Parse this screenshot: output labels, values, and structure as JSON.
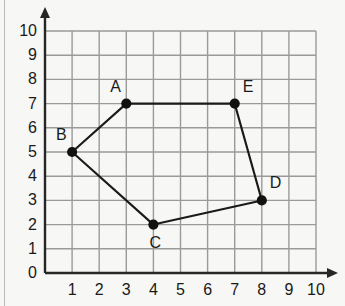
{
  "figure": {
    "background_color": "#f7f7f5",
    "grid_color": "#9a9a9a",
    "axis_color": "#262626",
    "point_color": "#111111",
    "edge_color": "#1a1a1a",
    "label_color": "#1a1a1a"
  },
  "chart_data": {
    "type": "scatter",
    "title": "",
    "xlabel": "",
    "ylabel": "",
    "xlim": [
      0,
      10
    ],
    "ylim": [
      0,
      10
    ],
    "grid": true,
    "legend": "none",
    "x_tick_labels": [
      "1",
      "2",
      "3",
      "4",
      "5",
      "6",
      "7",
      "8",
      "9",
      "10"
    ],
    "x_tick_values": [
      1,
      2,
      3,
      4,
      5,
      6,
      7,
      8,
      9,
      10
    ],
    "y_tick_labels": [
      "0",
      "1",
      "2",
      "3",
      "4",
      "5",
      "6",
      "7",
      "8",
      "9",
      "10"
    ],
    "y_tick_values": [
      0,
      1,
      2,
      3,
      4,
      5,
      6,
      7,
      8,
      9,
      10
    ],
    "origin_label": "0",
    "points": [
      {
        "name": "A",
        "x": 3,
        "y": 7,
        "label_position": "above-left"
      },
      {
        "name": "B",
        "x": 1,
        "y": 5,
        "label_position": "above-left"
      },
      {
        "name": "C",
        "x": 4,
        "y": 2,
        "label_position": "below"
      },
      {
        "name": "D",
        "x": 8,
        "y": 3,
        "label_position": "above-right"
      },
      {
        "name": "E",
        "x": 7,
        "y": 7,
        "label_position": "above-right"
      }
    ],
    "polygon": {
      "closed": true,
      "vertex_order": [
        "A",
        "B",
        "C",
        "D",
        "E"
      ],
      "edges": [
        {
          "from": "A",
          "to": "B"
        },
        {
          "from": "B",
          "to": "C"
        },
        {
          "from": "C",
          "to": "D"
        },
        {
          "from": "D",
          "to": "E"
        },
        {
          "from": "E",
          "to": "A"
        }
      ]
    }
  }
}
